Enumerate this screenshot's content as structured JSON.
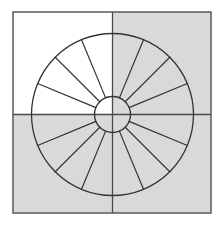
{
  "diagram": {
    "canvas": {
      "width": 223,
      "height": 229,
      "background": "#ffffff"
    },
    "frame": {
      "x": 13,
      "y": 12,
      "width": 198,
      "height": 201,
      "stroke": "#5a5a5a",
      "stroke_width": 1.5
    },
    "center": {
      "x": 112.5,
      "y": 114.5
    },
    "quadrants": [
      {
        "name": "top-left",
        "fill": "#ffffff"
      },
      {
        "name": "top-right",
        "fill": "#d9d9d9"
      },
      {
        "name": "bottom-left",
        "fill": "#d9d9d9"
      },
      {
        "name": "bottom-right",
        "fill": "#d9d9d9"
      }
    ],
    "outer_circle": {
      "radius": 81,
      "stroke": "#333333",
      "stroke_width": 1.3
    },
    "inner_circle": {
      "radius": 18,
      "stroke": "#333333",
      "stroke_width": 1.3,
      "fill": "none"
    },
    "sector_count": 16,
    "spoke_stroke": "#333333",
    "spoke_stroke_width": 1.2,
    "divider_stroke": "#4a4a4a",
    "divider_stroke_width": 1.3
  }
}
